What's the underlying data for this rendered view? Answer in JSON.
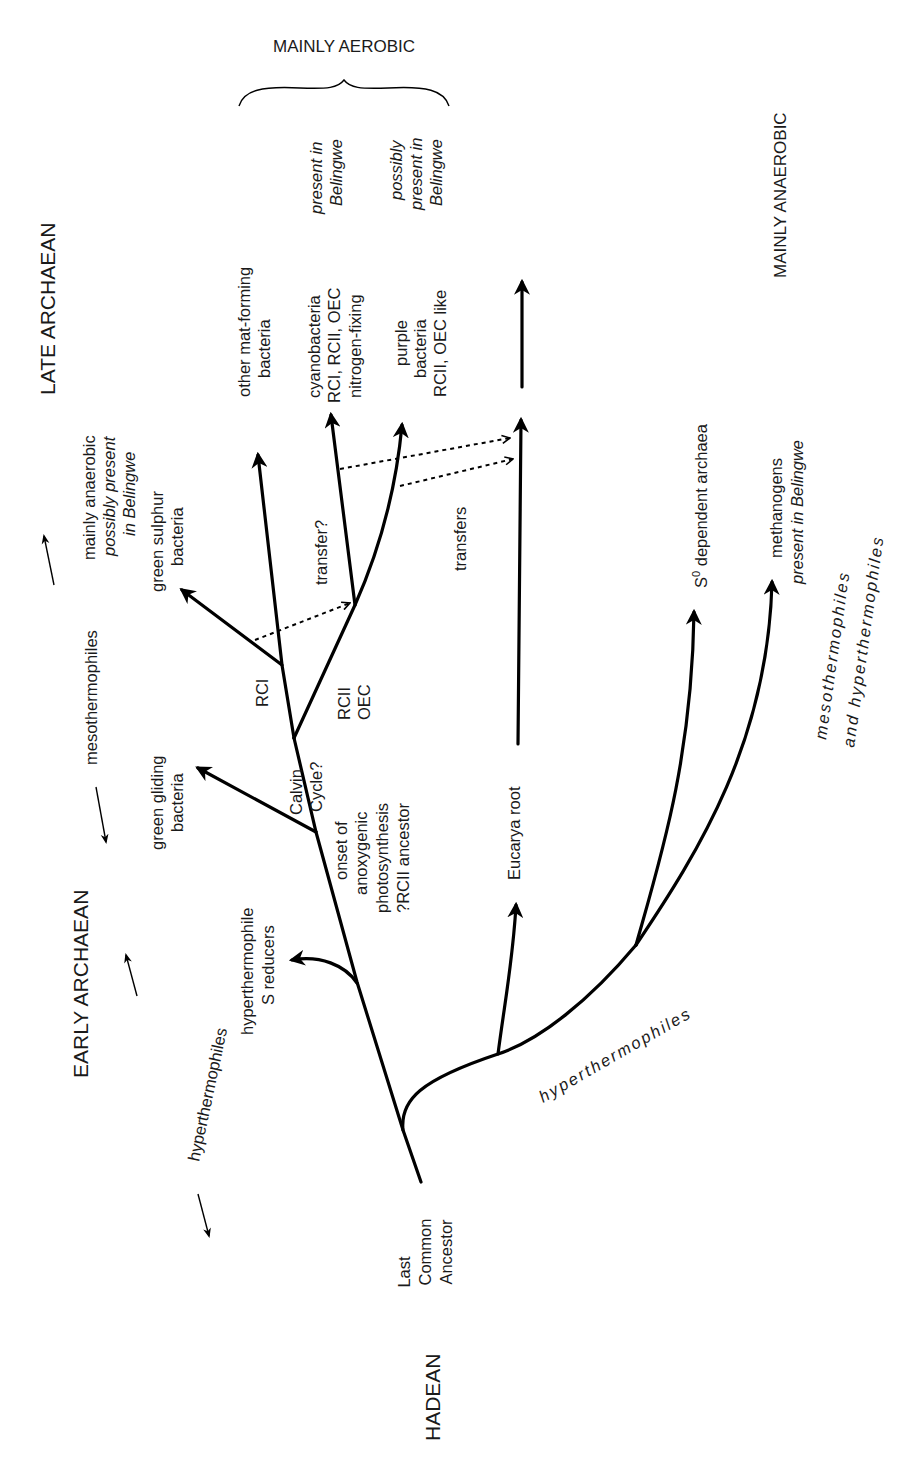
{
  "diagram": {
    "type": "phylogenetic-tree",
    "orientation": "rotated-90-ccw",
    "eras": {
      "hadean": "HADEAN",
      "early_archaean": "EARLY ARCHAEAN",
      "late_archaean": "LATE ARCHAEAN"
    },
    "temperature_axis": {
      "hyperthermophiles": "hyperthermophiles",
      "mesothermophiles": "mesothermophiles"
    },
    "oxygen_regimes": {
      "aerobic": "MAINLY AEROBIC",
      "anaerobic": "MAINLY ANAEROBIC"
    },
    "root": {
      "line1": "Last",
      "line2": "Common",
      "line3": "Ancestor"
    },
    "bacteria_branch": {
      "hyperthermophile_s_reducers": {
        "line1": "hyperthermophile",
        "line2": "S reducers"
      },
      "onset_note": {
        "line1": "onset of",
        "line2": "anoxygenic",
        "line3": "photosynthesis",
        "line4": "?RCII ancestor"
      },
      "calvin_cycle": {
        "line1": "Calvin",
        "line2": "Cycle?"
      },
      "green_gliding": {
        "line1": "green gliding",
        "line2": "bacteria"
      },
      "rci_label": "RCI",
      "rcii_oec_label": {
        "line1": "RCII",
        "line2": "OEC"
      },
      "green_sulphur": {
        "line1": "green sulphur",
        "line2": "bacteria"
      },
      "green_sulphur_note": {
        "line1": "mainly anaerobic",
        "line2": "possibly present",
        "line3": "in Belingwe"
      },
      "other_mat_forming": {
        "line1": "other mat-forming",
        "line2": "bacteria"
      },
      "transfer_q": "transfer?",
      "cyanobacteria": {
        "line1": "cyanobacteria",
        "line2": "RCI, RCII, OEC",
        "line3": "nitrogen-fixing"
      },
      "cyanobacteria_note": {
        "line1": "present in",
        "line2": "Belingwe"
      },
      "purple_bacteria": {
        "line1": "purple",
        "line2": "bacteria",
        "line3": "RCII, OEC like"
      },
      "purple_note": {
        "line1": "possibly",
        "line2": "present in",
        "line3": "Belingwe"
      }
    },
    "eucarya_branch": {
      "root_label": "Eucarya root",
      "transfers_label": "transfers"
    },
    "archaea_branch": {
      "stem_label": "hyperthermophiles",
      "s0_dependent": {
        "base": "S",
        "superscript": "0",
        "rest": " dependent archaea"
      },
      "methanogens": {
        "line1": "methanogens",
        "line2": "present in Belingwe"
      },
      "thermal_note": {
        "line1": "mesothermophiles",
        "line2": "and hyperthermophiles"
      }
    }
  }
}
